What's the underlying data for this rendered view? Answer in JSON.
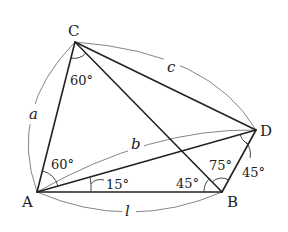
{
  "diagram": {
    "type": "quadrilateral-with-diagonals",
    "vertices": {
      "A": {
        "label": "A",
        "x": 37,
        "y": 192
      },
      "B": {
        "label": "B",
        "x": 222,
        "y": 192
      },
      "C": {
        "label": "C",
        "x": 75,
        "y": 42
      },
      "D": {
        "label": "D",
        "x": 256,
        "y": 130
      }
    },
    "segments": [
      {
        "from": "A",
        "to": "B"
      },
      {
        "from": "A",
        "to": "C"
      },
      {
        "from": "A",
        "to": "D"
      },
      {
        "from": "C",
        "to": "D"
      },
      {
        "from": "C",
        "to": "B"
      },
      {
        "from": "B",
        "to": "D"
      }
    ],
    "side_labels": {
      "a": "a",
      "b": "b",
      "c": "c",
      "l": "l"
    },
    "angle_labels": {
      "C_ACB": "60°",
      "A_CAD": "60°",
      "A_DAB": "15°",
      "B_ABC": "45°",
      "B_CBD": "75°",
      "D_BDx": "45°"
    }
  }
}
